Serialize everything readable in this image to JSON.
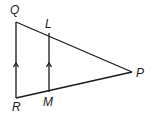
{
  "diagram": {
    "type": "geometry-triangle",
    "points": {
      "Q": {
        "label": "Q",
        "x": 16,
        "y": 22,
        "lx": 10,
        "ly": 14
      },
      "R": {
        "label": "R",
        "x": 16,
        "y": 98,
        "lx": 12,
        "ly": 111
      },
      "P": {
        "label": "P",
        "x": 132,
        "y": 72,
        "lx": 136,
        "ly": 77
      },
      "L": {
        "label": "L",
        "x": 49,
        "y": 33,
        "lx": 45,
        "ly": 27
      },
      "M": {
        "label": "M",
        "x": 49,
        "y": 92,
        "lx": 43,
        "ly": 105
      }
    },
    "segments": [
      "QR",
      "QP",
      "RP",
      "LM"
    ],
    "parallel_marks": [
      "QR",
      "LM"
    ],
    "stroke_color": "#1a1a1a"
  }
}
